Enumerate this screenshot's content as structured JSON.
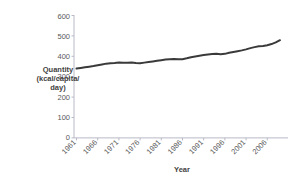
{
  "chart_data": {
    "type": "line",
    "title": "",
    "subtitle": "",
    "xlabel": "Year",
    "ylabel": "Quantity (kcal/capita/day)",
    "ylabel_lines": [
      "Quantity",
      "(kcal/capita/",
      "day)"
    ],
    "ylim": [
      0,
      600
    ],
    "xlim": [
      1961,
      2009
    ],
    "yticks": [
      0,
      100,
      200,
      300,
      400,
      500,
      600
    ],
    "ytick_labels": [
      "0",
      "100",
      "200",
      "300",
      "400",
      "500",
      "600"
    ],
    "xticks": [
      1961,
      1966,
      1971,
      1976,
      1981,
      1986,
      1991,
      1996,
      2001,
      2006
    ],
    "xtick_labels": [
      "1961",
      "1966",
      "1971",
      "1976",
      "1981",
      "1986",
      "1991",
      "1996",
      "2001",
      "2006"
    ],
    "grid": false,
    "legend": null,
    "legend_position": "none",
    "series_color": "#3a3a3a",
    "axis_color": "#b9b9c6",
    "x": [
      1961,
      1962,
      1963,
      1964,
      1965,
      1966,
      1967,
      1968,
      1969,
      1970,
      1971,
      1972,
      1973,
      1974,
      1975,
      1976,
      1977,
      1978,
      1979,
      1980,
      1981,
      1982,
      1983,
      1984,
      1985,
      1986,
      1987,
      1988,
      1989,
      1990,
      1991,
      1992,
      1993,
      1994,
      1995,
      1996,
      1997,
      1998,
      1999,
      2000,
      2001,
      2002,
      2003,
      2004,
      2005,
      2006,
      2007,
      2008,
      2009
    ],
    "values": [
      340,
      343,
      346,
      349,
      352,
      356,
      360,
      364,
      366,
      367,
      369,
      368,
      368,
      369,
      367,
      366,
      369,
      372,
      375,
      378,
      381,
      384,
      386,
      387,
      385,
      386,
      390,
      395,
      399,
      403,
      406,
      409,
      411,
      412,
      410,
      412,
      417,
      421,
      425,
      429,
      434,
      440,
      445,
      449,
      451,
      454,
      460,
      468,
      479
    ],
    "units": "kcal/capita/day",
    "value_range": [
      340,
      479
    ]
  },
  "axis_labels": {
    "x_title": "Year",
    "y_title_line1": "Quantity",
    "y_title_line2": "(kcal/capita/",
    "y_title_line3": "day)"
  }
}
